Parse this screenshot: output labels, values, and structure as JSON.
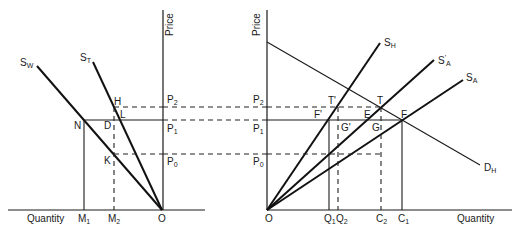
{
  "left_panel": {
    "axis_labels": {
      "price": "Price",
      "quantity": "Quantity"
    },
    "curves": [
      {
        "id": "SW",
        "base": "S",
        "sub": "W",
        "sup": ""
      },
      {
        "id": "ST",
        "base": "S",
        "sub": "T",
        "sup": ""
      }
    ],
    "points": {
      "H": "H",
      "L": "L",
      "N": "N",
      "D": "D",
      "K": "K",
      "O": "O"
    },
    "price_levels": [
      {
        "base": "P",
        "sub": "2"
      },
      {
        "base": "P",
        "sub": "1"
      },
      {
        "base": "P",
        "sub": "0"
      }
    ],
    "quantity_ticks": [
      {
        "base": "M",
        "sub": "1"
      },
      {
        "base": "M",
        "sub": "2"
      }
    ]
  },
  "right_panel": {
    "axis_labels": {
      "price": "Price",
      "quantity": "Quantity"
    },
    "curves": [
      {
        "id": "SH",
        "base": "S",
        "sub": "H",
        "sup": ""
      },
      {
        "id": "SA_prime",
        "base": "S",
        "sub": "A",
        "sup": "'"
      },
      {
        "id": "SA",
        "base": "S",
        "sub": "A",
        "sup": ""
      },
      {
        "id": "DH",
        "base": "D",
        "sub": "H",
        "sup": ""
      }
    ],
    "points": {
      "T_prime": "T'",
      "T": "T",
      "F_prime": "F'",
      "E": "E",
      "F": "F",
      "G_prime": "G'",
      "G": "G",
      "O": "O"
    },
    "price_levels": [
      {
        "base": "P",
        "sub": "2"
      },
      {
        "base": "P",
        "sub": "1"
      },
      {
        "base": "P",
        "sub": "0"
      }
    ],
    "quantity_ticks": [
      {
        "base": "Q",
        "sub": "1"
      },
      {
        "base": "Q",
        "sub": "2"
      },
      {
        "base": "C",
        "sub": "2"
      },
      {
        "base": "C",
        "sub": "1"
      }
    ]
  },
  "colors": {
    "ink": "#111111",
    "background": "#ffffff"
  }
}
